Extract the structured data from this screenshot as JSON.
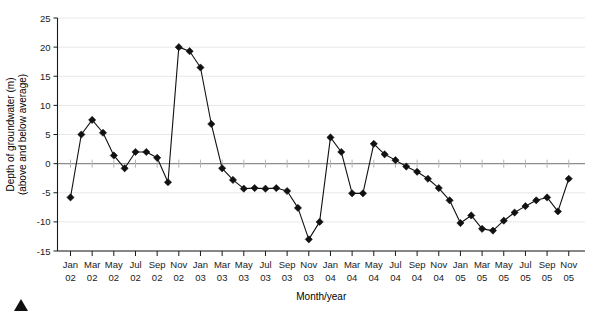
{
  "chart_data": {
    "type": "line",
    "title": "",
    "subtitle": "",
    "xlabel": "Month/year",
    "ylabel": "Depth of groundwater (m) (above and below average)",
    "ylabel_line1": "Depth of groundwater (m)",
    "ylabel_line2": "(above and below average)",
    "ylim": [
      -15,
      25
    ],
    "ytick_values": [
      -15,
      -10,
      -5,
      0,
      5,
      10,
      15,
      20,
      25
    ],
    "ytick_labels": [
      "-15",
      "-10",
      "-5",
      "0",
      "5",
      "10",
      "15",
      "20",
      "25"
    ],
    "grid": true,
    "grid_axis": "y",
    "legend": false,
    "legend_position": "none",
    "marker": "diamond",
    "line_color": "#111111",
    "marker_color": "#111111",
    "gridline_color": "#e8e8e8",
    "zeroline_color": "#8c8c8c",
    "axis_color": "#1a1a1a",
    "xtick_labels": [
      "Jan\n02",
      "Mar\n02",
      "May\n02",
      "Jul\n02",
      "Sep\n02",
      "Nov\n02",
      "Jan\n03",
      "Mar\n03",
      "May\n03",
      "Jul\n03",
      "Sep\n03",
      "Nov\n03",
      "Jan\n04",
      "Mar\n04",
      "May\n04",
      "Jul\n04",
      "Sep\n04",
      "Nov\n04",
      "Jan\n05",
      "Mar\n05",
      "May\n05",
      "Jul\n05",
      "Sep\n05",
      "Nov\n05"
    ],
    "xtick_months": [
      "Jan",
      "Mar",
      "May",
      "Jul",
      "Sep",
      "Nov",
      "Jan",
      "Mar",
      "May",
      "Jul",
      "Sep",
      "Nov",
      "Jan",
      "Mar",
      "May",
      "Jul",
      "Sep",
      "Nov",
      "Jan",
      "Mar",
      "May",
      "Jul",
      "Sep",
      "Nov"
    ],
    "xtick_years": [
      "02",
      "02",
      "02",
      "02",
      "02",
      "02",
      "03",
      "03",
      "03",
      "03",
      "03",
      "03",
      "04",
      "04",
      "04",
      "04",
      "04",
      "04",
      "05",
      "05",
      "05",
      "05",
      "05",
      "05"
    ],
    "x": [
      "Jan 02",
      "Feb 02",
      "Mar 02",
      "Apr 02",
      "May 02",
      "Jun 02",
      "Jul 02",
      "Aug 02",
      "Sep 02",
      "Oct 02",
      "Nov 02",
      "Dec 02",
      "Jan 03",
      "Feb 03",
      "Mar 03",
      "Apr 03",
      "May 03",
      "Jun 03",
      "Jul 03",
      "Aug 03",
      "Sep 03",
      "Oct 03",
      "Nov 03",
      "Dec 03",
      "Jan 04",
      "Feb 04",
      "Mar 04",
      "Apr 04",
      "May 04",
      "Jun 04",
      "Jul 04",
      "Aug 04",
      "Sep 04",
      "Oct 04",
      "Nov 04",
      "Dec 04",
      "Jan 05",
      "Feb 05",
      "Mar 05",
      "Apr 05",
      "May 05",
      "Jun 05",
      "Jul 05",
      "Aug 05",
      "Sep 05",
      "Oct 05",
      "Nov 05"
    ],
    "values": [
      -5.8,
      5.0,
      7.5,
      5.3,
      1.4,
      -0.8,
      2.0,
      2.0,
      1.0,
      -3.2,
      20.0,
      19.3,
      16.5,
      6.8,
      -0.8,
      -2.8,
      -4.3,
      -4.2,
      -4.3,
      -4.2,
      -4.7,
      -7.6,
      -13.0,
      -10.0,
      4.5,
      2.0,
      -5.1,
      -5.1,
      3.4,
      1.6,
      0.6,
      -0.5,
      -1.4,
      -2.6,
      -4.2,
      -6.3,
      -10.2,
      -8.9,
      -11.2,
      -11.5,
      -9.8,
      -8.4,
      -7.3,
      -6.3,
      -5.8,
      -8.2,
      -2.6
    ],
    "series": [
      {
        "name": "Depth of groundwater",
        "values": [
          -5.8,
          5.0,
          7.5,
          5.3,
          1.4,
          -0.8,
          2.0,
          2.0,
          1.0,
          -3.2,
          20.0,
          19.3,
          16.5,
          6.8,
          -0.8,
          -2.8,
          -4.3,
          -4.2,
          -4.3,
          -4.2,
          -4.7,
          -7.6,
          -13.0,
          -10.0,
          4.5,
          2.0,
          -5.1,
          -5.1,
          3.4,
          1.6,
          0.6,
          -0.5,
          -1.4,
          -2.6,
          -4.2,
          -6.3,
          -10.2,
          -8.9,
          -11.2,
          -11.5,
          -9.8,
          -8.4,
          -7.3,
          -6.3,
          -5.8,
          -8.2,
          -2.6
        ]
      }
    ]
  },
  "figure": {
    "corner_marker": "triangle-marker"
  }
}
